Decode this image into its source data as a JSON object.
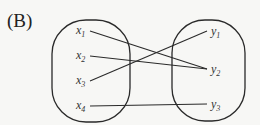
{
  "label": "(B)",
  "domain_set": {
    "name": "X",
    "elements": [
      {
        "var": "x",
        "sub": "1",
        "x": 76,
        "y": 34
      },
      {
        "var": "x",
        "sub": "2",
        "x": 76,
        "y": 59
      },
      {
        "var": "x",
        "sub": "3",
        "x": 76,
        "y": 84
      },
      {
        "var": "x",
        "sub": "4",
        "x": 76,
        "y": 109
      }
    ]
  },
  "codomain_set": {
    "name": "Y",
    "elements": [
      {
        "var": "y",
        "sub": "1",
        "x": 211,
        "y": 35
      },
      {
        "var": "y",
        "sub": "2",
        "x": 211,
        "y": 73
      },
      {
        "var": "y",
        "sub": "3",
        "x": 211,
        "y": 108
      }
    ]
  },
  "mappings": [
    {
      "from": "x1",
      "to": "y2"
    },
    {
      "from": "x2",
      "to": "y2"
    },
    {
      "from": "x3",
      "to": "y1"
    },
    {
      "from": "x4",
      "to": "y3"
    }
  ],
  "colors": {
    "stroke": "#2a2a2a",
    "background": "#f7f7f5"
  }
}
